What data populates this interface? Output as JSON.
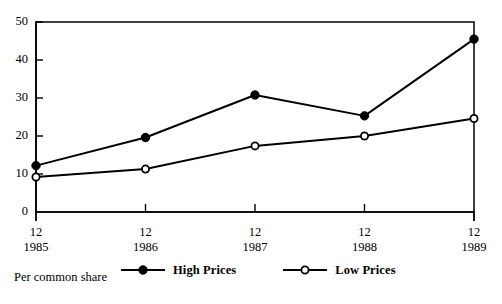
{
  "chart_data": {
    "type": "line",
    "title": "",
    "subtitle": "",
    "xlabel": "",
    "ylabel": "",
    "caption": "Per common share",
    "categories": [
      "12\n1985",
      "12\n1986",
      "12\n1987",
      "12\n1988",
      "12\n1989"
    ],
    "x_tick_top": [
      "12",
      "12",
      "12",
      "12",
      "12"
    ],
    "x_tick_bottom": [
      "1985",
      "1986",
      "1987",
      "1988",
      "1989"
    ],
    "y_ticks": [
      0,
      10,
      20,
      30,
      40,
      50
    ],
    "y_tick_labels": [
      "0",
      "10",
      "20",
      "30",
      "40",
      "50"
    ],
    "ylim": [
      0,
      50
    ],
    "grid": false,
    "legend_position": "bottom-center",
    "series": [
      {
        "name": "High Prices",
        "marker": "filled-circle",
        "values": [
          12.2,
          19.6,
          30.8,
          25.3,
          45.5
        ]
      },
      {
        "name": "Low Prices",
        "marker": "open-circle",
        "values": [
          9.2,
          11.3,
          17.4,
          20.0,
          24.6
        ]
      }
    ]
  },
  "legend": {
    "items": [
      {
        "label": "High Prices",
        "marker": "filled-circle"
      },
      {
        "label": "Low Prices",
        "marker": "open-circle"
      }
    ]
  },
  "colors": {
    "line": "#000000",
    "background": "#ffffff",
    "marker_fill_high": "#000000",
    "marker_fill_low": "#ffffff"
  }
}
